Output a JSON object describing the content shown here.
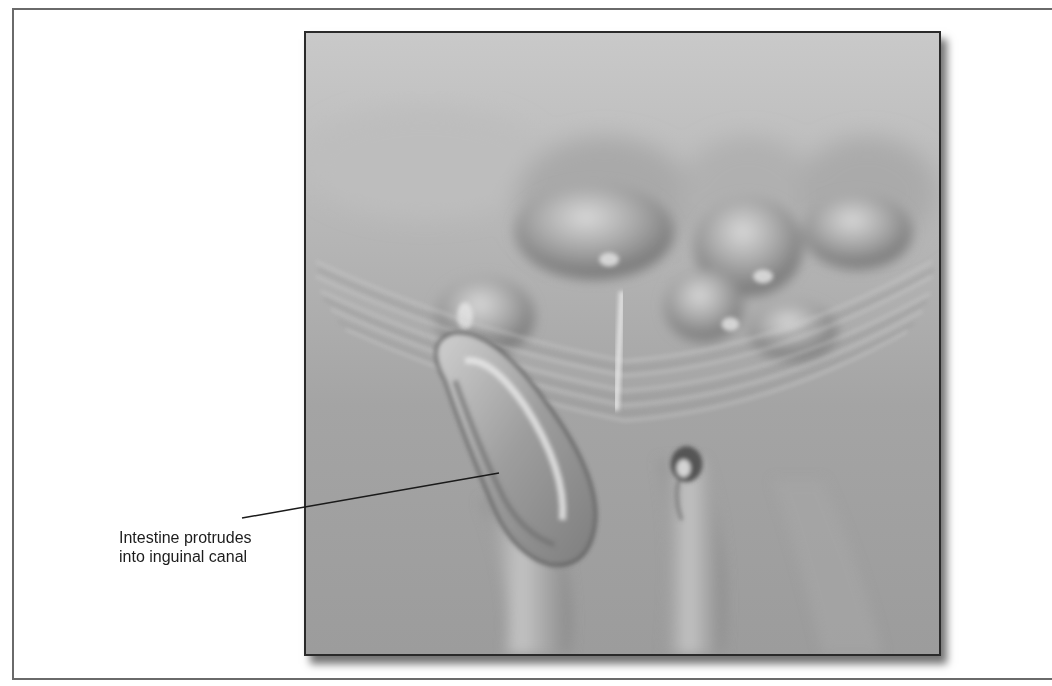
{
  "figure": {
    "callouts": [
      {
        "id": "intestine-protrusion",
        "lines": [
          "Intestine protrudes",
          "into inguinal canal"
        ],
        "leader": {
          "from": [
            242,
            518
          ],
          "to": [
            499,
            473
          ]
        }
      }
    ]
  },
  "colors": {
    "frame": "#6a6a6a",
    "illustration_border": "#2a2a2a",
    "background": "#ffffff",
    "tissue_base": "#a8a8a8",
    "label_text": "#1c1c1c"
  }
}
